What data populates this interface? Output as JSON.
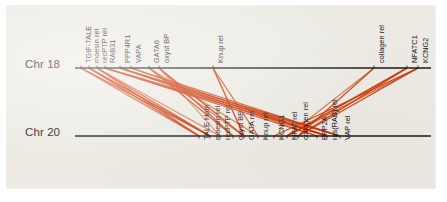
{
  "figure": {
    "background_color": "#eceae3",
    "line_color": "#cc3300",
    "axis_color": "#1a1a1a",
    "type": "synteny-comparison"
  },
  "axes": [
    {
      "id": "chr18",
      "label": "Chr 18",
      "y": 62,
      "x_start": 68,
      "x_end": 424
    },
    {
      "id": "chr20",
      "label": "Chr 20",
      "y": 130,
      "x_start": 68,
      "x_end": 424
    }
  ],
  "chart_data": {
    "type": "line",
    "title": "",
    "xlabel": "",
    "ylabel": "",
    "tracks": [
      {
        "name": "Chr 18",
        "genes": [
          {
            "label": "TGIF-TALE",
            "x": 74
          },
          {
            "label": "moesin rel",
            "x": 82
          },
          {
            "label": "recPTP rel",
            "x": 90
          },
          {
            "label": "RAB31",
            "x": 98
          },
          {
            "label": "PPP4R1",
            "x": 113
          },
          {
            "label": "VAPA",
            "x": 124
          },
          {
            "label": "GATA6",
            "x": 142
          },
          {
            "label": "oxyst BP",
            "x": 152
          },
          {
            "label": "Knup rel",
            "x": 206
          },
          {
            "label": "collagen rel",
            "x": 367
          },
          {
            "label": "NFATC1",
            "x": 400
          },
          {
            "label": "KCNG2",
            "x": 411
          }
        ]
      },
      {
        "name": "Chr 20",
        "genes": [
          {
            "label": "TALE Hom",
            "x": 192
          },
          {
            "label": "moesin rel",
            "x": 203
          },
          {
            "label": "recPTP rel",
            "x": 213
          },
          {
            "label": "oxyst BP",
            "x": 226
          },
          {
            "label": "GATA rel",
            "x": 237
          },
          {
            "label": "Knup rel",
            "x": 251
          },
          {
            "label": "KCNG1",
            "x": 267
          },
          {
            "label": "NFAT rel",
            "x": 280
          },
          {
            "label": "collagen rel",
            "x": 291
          },
          {
            "label": "PPP2A",
            "x": 310
          },
          {
            "label": "ras(RAB) rel",
            "x": 320
          },
          {
            "label": "VAP rel",
            "x": 333
          }
        ]
      }
    ],
    "links": [
      {
        "from": 74,
        "to": 192
      },
      {
        "from": 74,
        "to": 203
      },
      {
        "from": 82,
        "to": 192
      },
      {
        "from": 82,
        "to": 203
      },
      {
        "from": 90,
        "to": 213
      },
      {
        "from": 90,
        "to": 203
      },
      {
        "from": 98,
        "to": 320
      },
      {
        "from": 98,
        "to": 310
      },
      {
        "from": 113,
        "to": 310
      },
      {
        "from": 113,
        "to": 320
      },
      {
        "from": 124,
        "to": 333
      },
      {
        "from": 124,
        "to": 320
      },
      {
        "from": 142,
        "to": 237
      },
      {
        "from": 142,
        "to": 226
      },
      {
        "from": 152,
        "to": 226
      },
      {
        "from": 152,
        "to": 237
      },
      {
        "from": 152,
        "to": 213
      },
      {
        "from": 206,
        "to": 251
      },
      {
        "from": 206,
        "to": 237
      },
      {
        "from": 367,
        "to": 291
      },
      {
        "from": 367,
        "to": 280
      },
      {
        "from": 400,
        "to": 280
      },
      {
        "from": 400,
        "to": 291
      },
      {
        "from": 411,
        "to": 267
      },
      {
        "from": 411,
        "to": 280
      },
      {
        "from": 90,
        "to": 192
      },
      {
        "from": 98,
        "to": 333
      },
      {
        "from": 113,
        "to": 333
      },
      {
        "from": 142,
        "to": 251
      },
      {
        "from": 411,
        "to": 291
      }
    ]
  }
}
